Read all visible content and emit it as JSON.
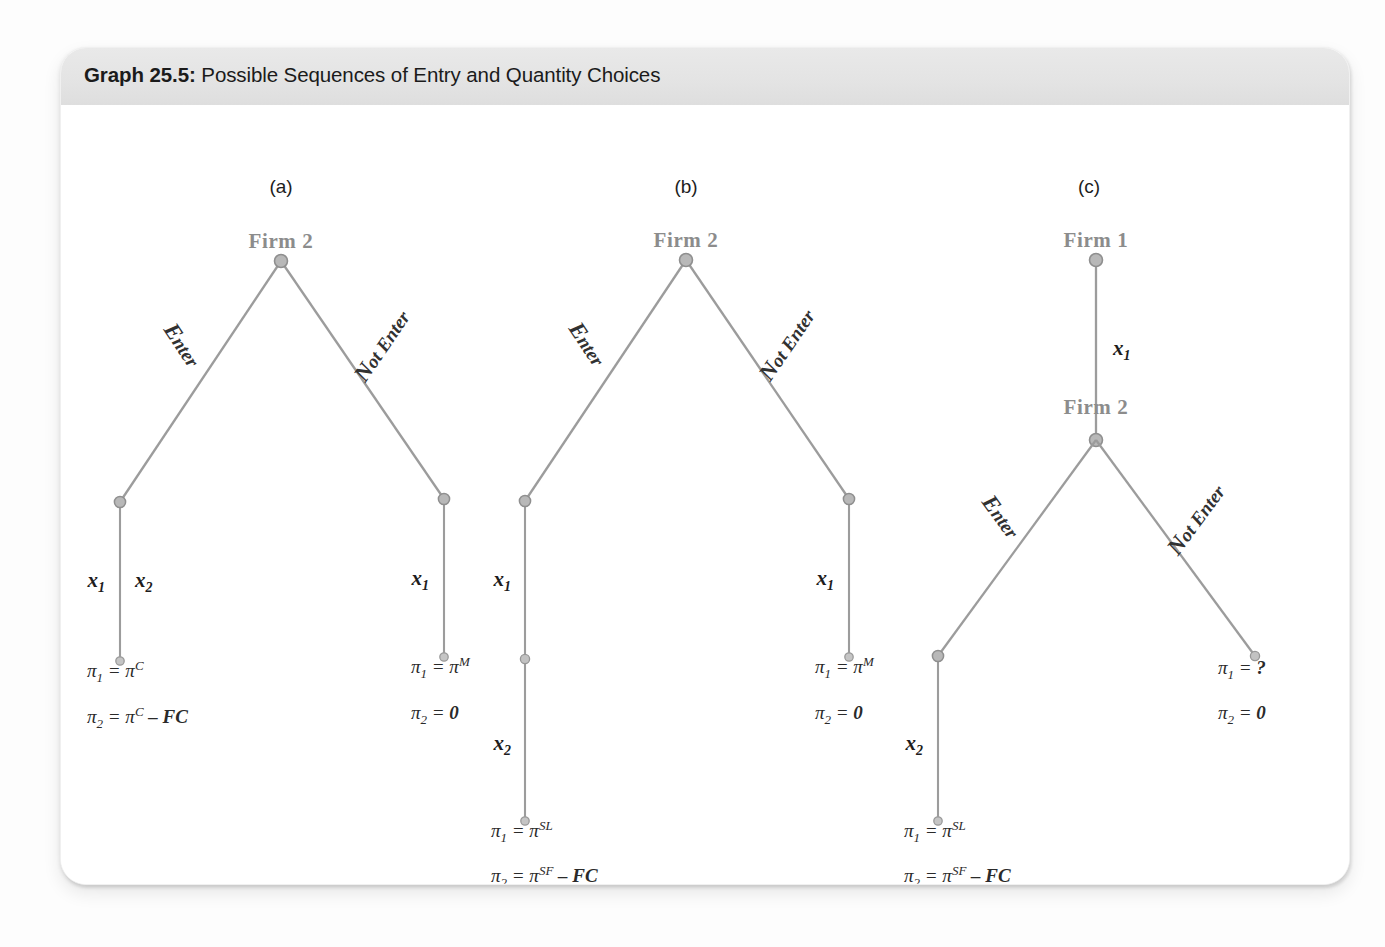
{
  "caption": {
    "label": "Graph 25.5:",
    "title": "Possible Sequences of Entry and Quantity Choices"
  },
  "panels": [
    {
      "id": "a",
      "label": "(a)",
      "root_label": "Firm 2",
      "branches": {
        "left": "Enter",
        "right": "Not Enter"
      },
      "quantities": {
        "left_a": "x",
        "left_a_sub": "1",
        "left_b": "x",
        "left_b_sub": "2",
        "right": "x",
        "right_sub": "1"
      },
      "payoffs": {
        "left_line1": {
          "pi": "π",
          "sub": "1",
          "eq": "=",
          "val": "π",
          "sup": "C",
          "extra": ""
        },
        "left_line2": {
          "pi": "π",
          "sub": "2",
          "eq": "=",
          "val": "π",
          "sup": "C",
          "extra": "– FC"
        },
        "right_line1": {
          "pi": "π",
          "sub": "1",
          "eq": "=",
          "val": "π",
          "sup": "M",
          "extra": ""
        },
        "right_line2": {
          "pi": "π",
          "sub": "2",
          "eq": "=",
          "val": "0",
          "sup": "",
          "extra": ""
        }
      }
    },
    {
      "id": "b",
      "label": "(b)",
      "root_label": "Firm 2",
      "branches": {
        "left": "Enter",
        "right": "Not Enter"
      },
      "quantities": {
        "left_first": "x",
        "left_first_sub": "1",
        "left_second": "x",
        "left_second_sub": "2",
        "right": "x",
        "right_sub": "1"
      },
      "payoffs": {
        "left_line1": {
          "pi": "π",
          "sub": "1",
          "eq": "=",
          "val": "π",
          "sup": "SL",
          "extra": ""
        },
        "left_line2": {
          "pi": "π",
          "sub": "2",
          "eq": "=",
          "val": "π",
          "sup": "SF",
          "extra": "– FC"
        },
        "right_line1": {
          "pi": "π",
          "sub": "1",
          "eq": "=",
          "val": "π",
          "sup": "M",
          "extra": ""
        },
        "right_line2": {
          "pi": "π",
          "sub": "2",
          "eq": "=",
          "val": "0",
          "sup": "",
          "extra": ""
        }
      }
    },
    {
      "id": "c",
      "label": "(c)",
      "root_label": "Firm 1",
      "second_label": "Firm 2",
      "branches": {
        "left": "Enter",
        "right": "Not Enter"
      },
      "quantities": {
        "top": "x",
        "top_sub": "1",
        "left_second": "x",
        "left_second_sub": "2"
      },
      "payoffs": {
        "left_line1": {
          "pi": "π",
          "sub": "1",
          "eq": "=",
          "val": "π",
          "sup": "SL",
          "extra": ""
        },
        "left_line2": {
          "pi": "π",
          "sub": "2",
          "eq": "=",
          "val": "π",
          "sup": "SF",
          "extra": "– FC"
        },
        "right_line1": {
          "pi": "π",
          "sub": "1",
          "eq": "=",
          "val": "?",
          "sup": "",
          "extra": ""
        },
        "right_line2": {
          "pi": "π",
          "sub": "2",
          "eq": "=",
          "val": "0",
          "sup": "",
          "extra": ""
        }
      }
    }
  ],
  "colors": {
    "line": "#9c9c9c",
    "node_fill": "#b8b8b8",
    "node_stroke": "#8f8f8f",
    "firm_text": "#8c8c8c",
    "caption_band": "#e4e4e4"
  }
}
